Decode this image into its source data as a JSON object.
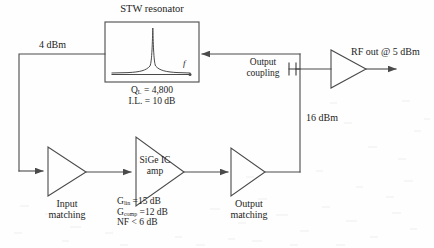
{
  "diagram": {
    "title_resonator": "STW resonator",
    "resonator_axis_label": "f",
    "resonator_specs": [
      {
        "pre": "Q",
        "sub": "L",
        "post": " = 4,800"
      },
      {
        "pre": "I.L. = 10 dB",
        "sub": "",
        "post": ""
      }
    ],
    "power_levels": {
      "input_to_resonator": "4 dBm",
      "loop_drive": "16 dBm",
      "rf_out": "RF out @ 5 dBm"
    },
    "blocks": {
      "input_matching_line1": "Input",
      "input_matching_line2": "matching",
      "sige_amp_line1": "SiGe IC",
      "sige_amp_line2": "amp",
      "output_matching_line1": "Output",
      "output_matching_line2": "matching",
      "output_coupling_line1": "Output",
      "output_coupling_line2": "coupling"
    },
    "amp_specs": [
      {
        "pre": "G",
        "sub": "lin",
        "post": " =15 dB"
      },
      {
        "pre": "G",
        "sub": "comp",
        "post": " =12 dB"
      },
      {
        "pre": "NF < 6 dB",
        "sub": "",
        "post": ""
      }
    ],
    "colors": {
      "line": "#4a4a4a",
      "text": "#1d1d1d",
      "background": "#fefefe"
    }
  }
}
